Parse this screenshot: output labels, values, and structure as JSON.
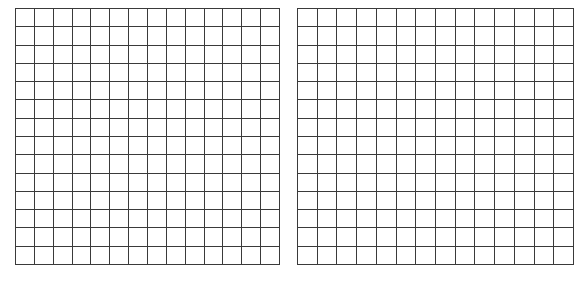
{
  "grids": {
    "left": {
      "rows": 14,
      "cols": 14,
      "line_color": "#3a3a3a"
    },
    "right": {
      "rows": 14,
      "cols": 14,
      "line_color": "#3a3a3a"
    }
  },
  "background": "#ffffff"
}
